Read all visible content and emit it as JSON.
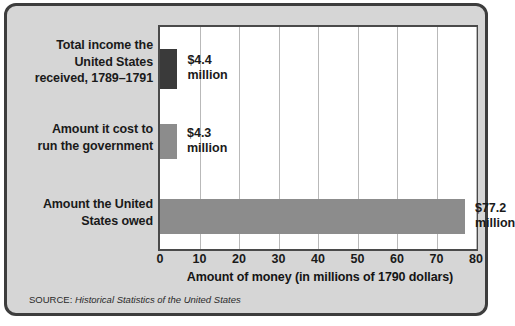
{
  "figure": {
    "background_color": "#d6d6d6",
    "border_color": "#3d3d3d",
    "plot_background_color": "#ffffff",
    "gridline_color": "#b9b9b9"
  },
  "source_note": {
    "prefix": "SOURCE: ",
    "title": "Historical Statistics of the United States"
  },
  "chart_data": {
    "type": "bar",
    "orientation": "horizontal",
    "title": "",
    "xlabel": "Amount of money (in millions of 1790 dollars)",
    "ylabel": "",
    "xlim": [
      0,
      80
    ],
    "xticks": [
      0,
      10,
      20,
      30,
      40,
      50,
      60,
      70,
      80
    ],
    "xtick_labels": [
      "0",
      "10",
      "20",
      "30",
      "40",
      "50",
      "60",
      "70",
      "80"
    ],
    "grid": "vertical",
    "legend": "none",
    "categories": [
      "Total income the\nUnited States\nreceived, 1789–1791",
      "Amount it cost to\nrun the government",
      "Amount the United\nStates owed"
    ],
    "values": [
      4.4,
      4.3,
      77.2
    ],
    "value_labels": [
      "$4.4\nmillion",
      "$4.3\nmillion",
      "$77.2\nmillion"
    ],
    "bar_colors": [
      "#3a3a3a",
      "#8c8c8c",
      "#8c8c8c"
    ],
    "units": "millions of 1790 dollars"
  }
}
